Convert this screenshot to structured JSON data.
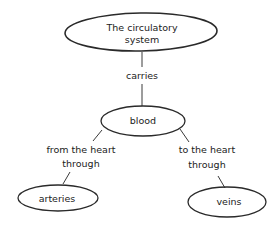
{
  "diagram": {
    "type": "concept-map",
    "nodes": [
      {
        "id": "root",
        "lines": [
          "The circulatory",
          "system"
        ]
      },
      {
        "id": "blood",
        "lines": [
          "blood"
        ]
      },
      {
        "id": "arteries",
        "lines": [
          "arteries"
        ]
      },
      {
        "id": "veins",
        "lines": [
          "veins"
        ]
      }
    ],
    "links": [
      {
        "from": "root",
        "to": "blood",
        "lines": [
          "carries"
        ]
      },
      {
        "from": "blood",
        "to": "arteries",
        "lines": [
          "from the heart",
          "through"
        ]
      },
      {
        "from": "blood",
        "to": "veins",
        "lines": [
          "to the heart",
          "through"
        ]
      }
    ],
    "colors": {
      "stroke": "#2a2a2a",
      "text": "#222222",
      "background": "#ffffff"
    }
  }
}
